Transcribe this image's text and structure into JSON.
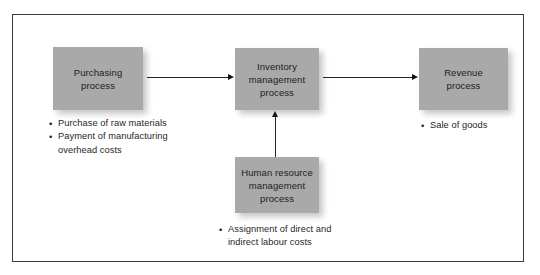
{
  "diagram": {
    "frame_border_color": "#3a3a3a",
    "box_fill_color": "#a9a9a9",
    "arrow_color": "#262626",
    "boxes": [
      {
        "id": "purchasing",
        "label": "Purchasing\nprocess",
        "line1": "Purchasing",
        "line2": "process"
      },
      {
        "id": "inventory",
        "label": "Inventory management process",
        "line1": "Inventory",
        "line2": "management",
        "line3": "process"
      },
      {
        "id": "revenue",
        "label": "Revenue process",
        "line1": "Revenue",
        "line2": "process"
      },
      {
        "id": "hr",
        "label": "Human resource management process",
        "line1": "Human resource",
        "line2": "management",
        "line3": "process"
      }
    ],
    "bullet_lists": {
      "purchasing": [
        "Purchase of raw materials",
        "Payment of manufacturing overhead costs"
      ],
      "revenue": [
        "Sale of goods"
      ],
      "hr": [
        "Assignment of direct and indirect labour costs"
      ]
    },
    "arrows": [
      {
        "id": "purchasing-to-inventory",
        "from": "purchasing",
        "to": "inventory",
        "direction": "right"
      },
      {
        "id": "inventory-to-revenue",
        "from": "inventory",
        "to": "revenue",
        "direction": "right"
      },
      {
        "id": "hr-to-inventory",
        "from": "hr",
        "to": "inventory",
        "direction": "up"
      }
    ]
  }
}
